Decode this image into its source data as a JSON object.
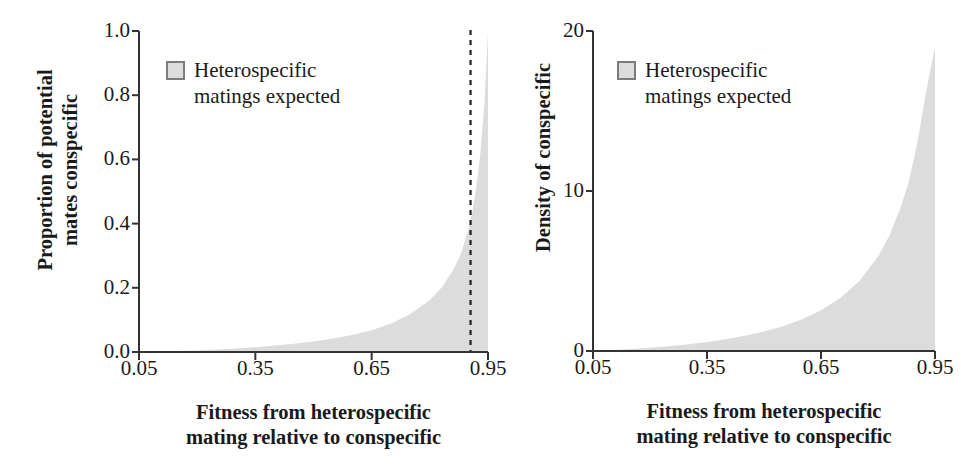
{
  "figure": {
    "background": "#ffffff",
    "fill_color": "#dcdcdc",
    "axis_color": "#333333",
    "text_color": "#1a1a1a",
    "swatch_border": "#7c7c7c"
  },
  "chart_data": [
    {
      "id": "left",
      "type": "area",
      "title": "",
      "xlabel": "Fitness from heterospecific\nmating relative to conspecific",
      "ylabel": "Proportion of potential\nmates conspecific",
      "xlim": [
        0.05,
        0.95
      ],
      "ylim": [
        0.0,
        1.0
      ],
      "grid": false,
      "xticks": [
        0.05,
        0.35,
        0.65,
        0.95
      ],
      "xticklabels": [
        "0.05",
        "0.35",
        "0.65",
        "0.95"
      ],
      "yticks": [
        0.0,
        0.2,
        0.4,
        0.6,
        0.8,
        1.0
      ],
      "yticklabels": [
        "0.0",
        "0.2",
        "0.4",
        "0.6",
        "0.8",
        "1.0"
      ],
      "legend": {
        "position": "upper-left-inside",
        "entries": [
          {
            "marker": "filled-square",
            "label": "Heterospecific\nmatings expected"
          }
        ]
      },
      "annotations": [
        {
          "type": "vertical-dashed-line",
          "x": 0.905,
          "label": ""
        }
      ],
      "series": [
        {
          "name": "Heterospecific matings expected",
          "fill": "#dcdcdc",
          "x": [
            0.05,
            0.1,
            0.15,
            0.2,
            0.25,
            0.3,
            0.35,
            0.4,
            0.45,
            0.5,
            0.55,
            0.6,
            0.65,
            0.7,
            0.75,
            0.8,
            0.83,
            0.86,
            0.88,
            0.9,
            0.91,
            0.92,
            0.93,
            0.94,
            0.945,
            0.95
          ],
          "values": [
            0.0,
            0.001,
            0.003,
            0.005,
            0.008,
            0.011,
            0.015,
            0.02,
            0.026,
            0.033,
            0.042,
            0.053,
            0.068,
            0.089,
            0.118,
            0.162,
            0.2,
            0.255,
            0.305,
            0.385,
            0.44,
            0.515,
            0.615,
            0.76,
            0.87,
            1.0
          ]
        }
      ]
    },
    {
      "id": "right",
      "type": "area",
      "title": "",
      "xlabel": "Fitness from heterospecific\nmating relative to conspecific",
      "ylabel": "Density of conspecific",
      "xlim": [
        0.05,
        0.95
      ],
      "ylim": [
        0,
        20
      ],
      "grid": false,
      "xticks": [
        0.05,
        0.35,
        0.65,
        0.95
      ],
      "xticklabels": [
        "0.05",
        "0.35",
        "0.65",
        "0.95"
      ],
      "yticks": [
        0,
        10,
        20
      ],
      "yticklabels": [
        "0",
        "10",
        "20"
      ],
      "legend": {
        "position": "upper-left-inside",
        "entries": [
          {
            "marker": "filled-square",
            "label": "Heterospecific\nmatings expected"
          }
        ]
      },
      "annotations": [],
      "series": [
        {
          "name": "Heterospecific matings expected",
          "fill": "#dcdcdc",
          "x": [
            0.05,
            0.1,
            0.15,
            0.2,
            0.25,
            0.3,
            0.35,
            0.4,
            0.45,
            0.5,
            0.55,
            0.6,
            0.65,
            0.7,
            0.75,
            0.8,
            0.83,
            0.86,
            0.88,
            0.9,
            0.91,
            0.92,
            0.93,
            0.94,
            0.945,
            0.95
          ],
          "values": [
            0.0,
            0.05,
            0.12,
            0.2,
            0.3,
            0.42,
            0.56,
            0.74,
            0.96,
            1.22,
            1.55,
            1.98,
            2.55,
            3.3,
            4.35,
            5.9,
            7.2,
            9.0,
            10.5,
            12.6,
            13.9,
            15.3,
            16.6,
            17.8,
            18.4,
            19.0
          ]
        }
      ]
    }
  ]
}
